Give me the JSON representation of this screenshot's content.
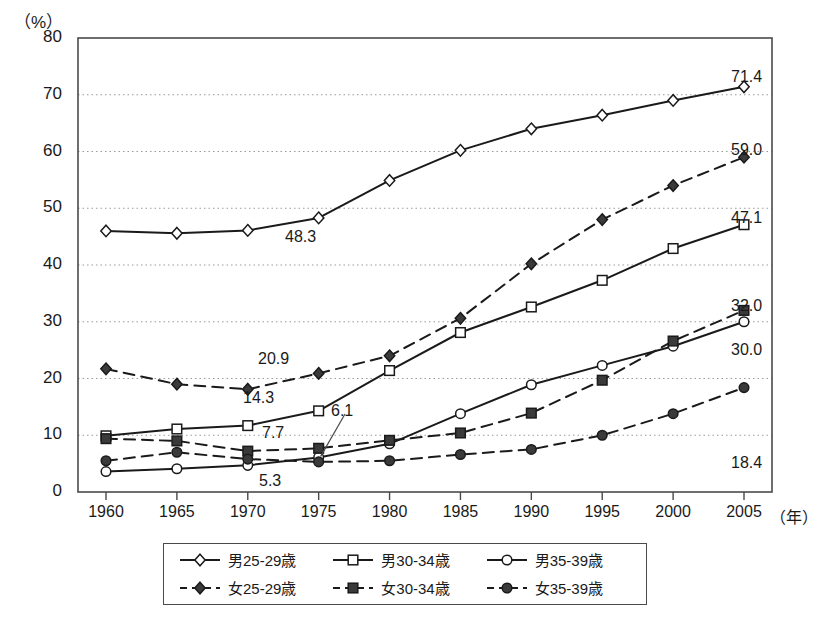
{
  "axis": {
    "y_unit": "（%）",
    "x_unit": "（年）",
    "y_ticks": [
      "80",
      "70",
      "60",
      "50",
      "40",
      "30",
      "20",
      "10",
      "0"
    ],
    "x_ticks": [
      "1960",
      "1965",
      "1970",
      "1975",
      "1980",
      "1985",
      "1990",
      "1995",
      "2000",
      "2005"
    ]
  },
  "legend": {
    "items": [
      {
        "label": "男25-29歳",
        "key": "open-diamond-solid"
      },
      {
        "label": "男30-34歳",
        "key": "open-square-solid"
      },
      {
        "label": "男35-39歳",
        "key": "open-circle-solid"
      },
      {
        "label": "女25-29歳",
        "key": "filled-diamond-dashed"
      },
      {
        "label": "女30-34歳",
        "key": "filled-square-dashed"
      },
      {
        "label": "女35-39歳",
        "key": "filled-circle-dashed"
      }
    ]
  },
  "annotations": [
    {
      "text": "48.3",
      "x": 285,
      "y": 228
    },
    {
      "text": "71.4",
      "x": 731,
      "y": 68
    },
    {
      "text": "59.0",
      "x": 731,
      "y": 141
    },
    {
      "text": "47.1",
      "x": 731,
      "y": 209
    },
    {
      "text": "32.0",
      "x": 731,
      "y": 297
    },
    {
      "text": "30.0",
      "x": 731,
      "y": 341
    },
    {
      "text": "18.4",
      "x": 731,
      "y": 454
    },
    {
      "text": "20.9",
      "x": 258,
      "y": 350
    },
    {
      "text": "14.3",
      "x": 243,
      "y": 389
    },
    {
      "text": "7.7",
      "x": 262,
      "y": 424
    },
    {
      "text": "6.1",
      "x": 331,
      "y": 402
    },
    {
      "text": "5.3",
      "x": 259,
      "y": 472
    }
  ],
  "chart_data": {
    "type": "line",
    "title": "",
    "xlabel": "（年）",
    "ylabel": "（%）",
    "ylim": [
      0,
      80
    ],
    "grid": true,
    "legend_position": "bottom",
    "x": [
      1960,
      1965,
      1970,
      1975,
      1980,
      1985,
      1990,
      1995,
      2000,
      2005
    ],
    "series": [
      {
        "name": "男25-29歳",
        "style": "solid",
        "marker": "open-diamond",
        "values": [
          46.0,
          45.6,
          46.1,
          48.3,
          54.9,
          60.2,
          64.0,
          66.4,
          69.0,
          71.4
        ]
      },
      {
        "name": "男30-34歳",
        "style": "solid",
        "marker": "open-square",
        "values": [
          9.9,
          11.1,
          11.7,
          14.3,
          21.4,
          28.1,
          32.6,
          37.3,
          42.9,
          47.1
        ]
      },
      {
        "name": "男35-39歳",
        "style": "solid",
        "marker": "open-circle",
        "values": [
          3.6,
          4.1,
          4.7,
          6.1,
          8.5,
          13.8,
          18.9,
          22.3,
          25.7,
          30.0
        ]
      },
      {
        "name": "女25-29歳",
        "style": "dashed",
        "marker": "filled-diamond",
        "values": [
          21.7,
          19.0,
          18.1,
          20.9,
          24.0,
          30.6,
          40.2,
          48.0,
          54.0,
          59.0
        ]
      },
      {
        "name": "女30-34歳",
        "style": "dashed",
        "marker": "filled-square",
        "values": [
          9.4,
          9.0,
          7.2,
          7.7,
          9.1,
          10.4,
          13.9,
          19.7,
          26.6,
          32.0
        ]
      },
      {
        "name": "女35-39歳",
        "style": "dashed",
        "marker": "filled-circle",
        "values": [
          5.5,
          7.0,
          5.8,
          5.3,
          5.5,
          6.6,
          7.5,
          10.0,
          13.8,
          18.4
        ]
      }
    ]
  }
}
